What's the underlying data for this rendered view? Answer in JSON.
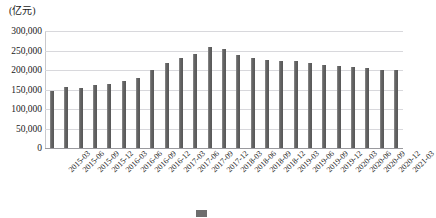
{
  "chart_data": {
    "type": "bar",
    "title": "",
    "subtitle": "",
    "unit_label": "(亿元)",
    "xlabel": "",
    "ylabel": "",
    "ylim": [
      0,
      300000
    ],
    "grid": true,
    "legend_position": "bottom",
    "categories": [
      "2015-03",
      "2015-06",
      "2015-09",
      "2015-12",
      "2016-03",
      "2016-06",
      "2016-09",
      "2016-12",
      "2017-03",
      "2017-06",
      "2017-09",
      "2017-12",
      "2018-03",
      "2018-06",
      "2018-09",
      "2018-12",
      "2019-03",
      "2019-06",
      "2019-09",
      "2019-12",
      "2020-03",
      "2020-06",
      "2020-09",
      "2020-12",
      "2021-03"
    ],
    "values": [
      145000,
      157000,
      155000,
      161000,
      164000,
      171000,
      180000,
      201000,
      218000,
      230000,
      242000,
      260000,
      254000,
      239000,
      230000,
      225000,
      224000,
      223000,
      217000,
      213000,
      210000,
      209000,
      205000,
      201000,
      200000
    ],
    "yticks": [
      "0",
      "50,000",
      "100,000",
      "150,000",
      "200,000",
      "250,000",
      "300,000"
    ],
    "ytick_values": [
      0,
      50000,
      100000,
      150000,
      200000,
      250000,
      300000
    ],
    "series": [
      {
        "name": "",
        "color": "#6d6d6d",
        "values": [
          145000,
          157000,
          155000,
          161000,
          164000,
          171000,
          180000,
          201000,
          218000,
          230000,
          242000,
          260000,
          254000,
          239000,
          230000,
          225000,
          224000,
          223000,
          217000,
          213000,
          210000,
          209000,
          205000,
          201000,
          200000
        ]
      }
    ]
  },
  "caption": {
    "text": "",
    "swatch_color": "#6d6d6d"
  },
  "colors": {
    "bar": "#6d6d6d",
    "grid": "#d8d8dc",
    "axis": "#9a9a9e",
    "text": "#1a1a1a"
  }
}
